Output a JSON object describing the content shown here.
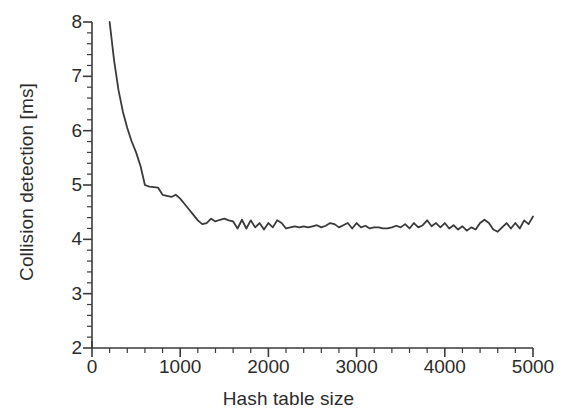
{
  "chart_data": {
    "type": "line",
    "title": "",
    "xlabel": "Hash table size",
    "ylabel": "Collision detection [ms]",
    "xlim": [
      0,
      5000
    ],
    "ylim": [
      2,
      8
    ],
    "xticks": [
      0,
      1000,
      2000,
      3000,
      4000,
      5000
    ],
    "xtick_labels": [
      "0",
      "1000",
      "2000",
      "3000",
      "4000",
      "5000"
    ],
    "yticks": [
      2,
      3,
      4,
      5,
      6,
      7,
      8
    ],
    "ytick_labels": [
      "2",
      "3",
      "4",
      "5",
      "6",
      "7",
      "8"
    ],
    "x_minor_tick_interval": 200,
    "y_minor_tick_interval": 0.2,
    "grid": false,
    "legend": null,
    "line_color": "#3a3a3a",
    "line_width": 1.8,
    "series": [
      {
        "name": "Collision detection time",
        "x": [
          200,
          250,
          300,
          350,
          400,
          450,
          500,
          550,
          600,
          650,
          700,
          750,
          800,
          850,
          900,
          950,
          1000,
          1050,
          1100,
          1150,
          1200,
          1250,
          1300,
          1350,
          1400,
          1450,
          1500,
          1550,
          1600,
          1650,
          1700,
          1750,
          1800,
          1850,
          1900,
          1950,
          2000,
          2050,
          2100,
          2150,
          2200,
          2250,
          2300,
          2350,
          2400,
          2450,
          2500,
          2550,
          2600,
          2650,
          2700,
          2750,
          2800,
          2850,
          2900,
          2950,
          3000,
          3050,
          3100,
          3150,
          3200,
          3250,
          3300,
          3350,
          3400,
          3450,
          3500,
          3550,
          3600,
          3650,
          3700,
          3750,
          3800,
          3850,
          3900,
          3950,
          4000,
          4050,
          4100,
          4150,
          4200,
          4250,
          4300,
          4350,
          4400,
          4450,
          4500,
          4550,
          4600,
          4650,
          4700,
          4750,
          4800,
          4850,
          4900,
          4950,
          5000
        ],
        "y": [
          8.0,
          7.3,
          6.75,
          6.35,
          6.05,
          5.8,
          5.6,
          5.35,
          5.0,
          4.97,
          4.96,
          4.95,
          4.82,
          4.8,
          4.78,
          4.82,
          4.75,
          4.65,
          4.55,
          4.45,
          4.35,
          4.28,
          4.3,
          4.38,
          4.33,
          4.36,
          4.38,
          4.35,
          4.33,
          4.2,
          4.36,
          4.2,
          4.35,
          4.22,
          4.3,
          4.18,
          4.3,
          4.22,
          4.35,
          4.3,
          4.2,
          4.22,
          4.24,
          4.22,
          4.24,
          4.22,
          4.24,
          4.26,
          4.22,
          4.25,
          4.3,
          4.28,
          4.22,
          4.26,
          4.3,
          4.2,
          4.3,
          4.22,
          4.25,
          4.2,
          4.22,
          4.22,
          4.2,
          4.2,
          4.22,
          4.25,
          4.22,
          4.28,
          4.2,
          4.3,
          4.22,
          4.26,
          4.35,
          4.24,
          4.3,
          4.22,
          4.3,
          4.2,
          4.26,
          4.18,
          4.24,
          4.16,
          4.22,
          4.18,
          4.3,
          4.36,
          4.3,
          4.18,
          4.14,
          4.22,
          4.3,
          4.2,
          4.3,
          4.2,
          4.35,
          4.28,
          4.42
        ]
      }
    ]
  },
  "axes": {
    "x_axis_name": "hash-table-size-axis",
    "y_axis_name": "collision-detection-axis"
  }
}
